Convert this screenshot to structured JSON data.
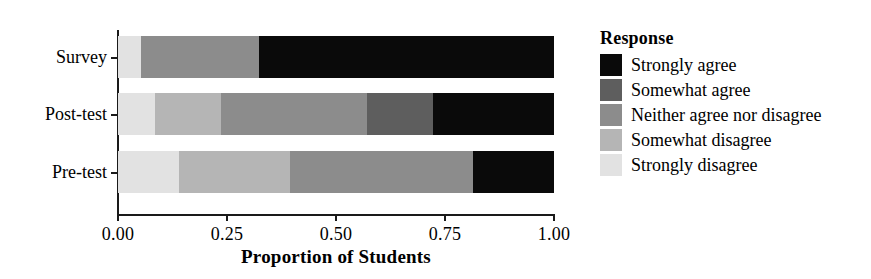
{
  "chart_data": {
    "type": "bar",
    "orientation": "horizontal",
    "stacked": true,
    "normalized": true,
    "title": "",
    "xlabel": "Proportion of Students",
    "ylabel": "",
    "xlim": [
      0.0,
      1.0
    ],
    "grid": false,
    "categories": [
      "Pre-test",
      "Post-test",
      "Survey"
    ],
    "category_order_top_to_bottom": [
      "Survey",
      "Post-test",
      "Pre-test"
    ],
    "xticks": [
      0.0,
      0.25,
      0.5,
      0.75,
      1.0
    ],
    "xtick_labels": [
      "0.00",
      "0.25",
      "0.50",
      "0.75",
      "1.00"
    ],
    "legend_title": "Response",
    "legend_position": "right",
    "series": [
      {
        "name": "Strongly disagree",
        "color": "#e2e2e2",
        "values": [
          0.14,
          0.085,
          0.053
        ]
      },
      {
        "name": "Somewhat disagree",
        "color": "#b5b5b5",
        "values": [
          0.255,
          0.151,
          0.0
        ]
      },
      {
        "name": "Neither agree nor disagree",
        "color": "#8c8c8c",
        "values": [
          0.419,
          0.335,
          0.27
        ]
      },
      {
        "name": "Somewhat agree",
        "color": "#5e5e5e",
        "values": [
          0.0,
          0.151,
          0.0
        ]
      },
      {
        "name": "Strongly agree",
        "color": "#0a0a0a",
        "values": [
          0.186,
          0.278,
          0.677
        ]
      }
    ],
    "stack_boundaries": {
      "Survey": [
        0.0,
        0.053,
        0.053,
        0.323,
        0.323,
        1.0
      ],
      "Post-test": [
        0.0,
        0.085,
        0.236,
        0.571,
        0.722,
        1.0
      ],
      "Pre-test": [
        0.0,
        0.14,
        0.395,
        0.814,
        0.814,
        1.0
      ]
    }
  },
  "axis": {
    "x_title": "Proportion of Students",
    "x_tick_labels": [
      "0.00",
      "0.25",
      "0.50",
      "0.75",
      "1.00"
    ],
    "y_tick_labels": [
      "Survey",
      "Post-test",
      "Pre-test"
    ]
  },
  "legend": {
    "title": "Response",
    "items": [
      {
        "label": "Strongly agree",
        "color": "#0a0a0a"
      },
      {
        "label": "Somewhat agree",
        "color": "#5e5e5e"
      },
      {
        "label": "Neither agree nor disagree",
        "color": "#8c8c8c"
      },
      {
        "label": "Somewhat disagree",
        "color": "#b5b5b5"
      },
      {
        "label": "Strongly disagree",
        "color": "#e2e2e2"
      }
    ]
  }
}
